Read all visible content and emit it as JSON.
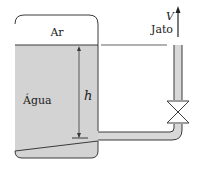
{
  "labels": {
    "air": "Ar",
    "water": "Água",
    "height": "h",
    "velocity": "V",
    "jet": "Jato"
  },
  "colors": {
    "water_fill": "#d3d3d3",
    "stroke": "#3a3a3a",
    "pipe_fill": "#d8d8d8",
    "background": "#ffffff"
  }
}
